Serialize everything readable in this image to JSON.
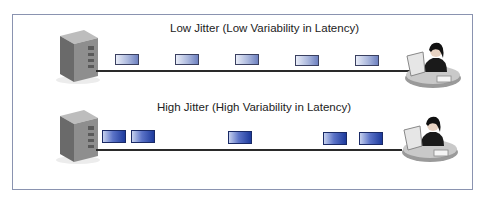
{
  "diagram": {
    "type": "network-jitter-comparison",
    "colors": {
      "frame_border": "#8a93b0",
      "wire": "#2a2a2a",
      "low_packet": "#a9b6dc",
      "high_packet": "#1d3a9c"
    },
    "rows": [
      {
        "label": "Low Jitter (Low Variability in Latency)",
        "source_icon": "server-tower-icon",
        "dest_icon": "user-at-workstation-icon",
        "packets_x": [
          115,
          175,
          235,
          295,
          355
        ],
        "spacing": "even"
      },
      {
        "label": "High Jitter (High Variability in Latency)",
        "source_icon": "server-tower-icon",
        "dest_icon": "user-at-workstation-icon",
        "packets_x": [
          102,
          131,
          228,
          323,
          359
        ],
        "spacing": "uneven"
      }
    ]
  }
}
